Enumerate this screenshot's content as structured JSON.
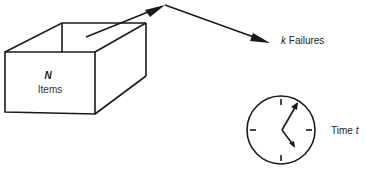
{
  "diagram": {
    "box": {
      "count_symbol": "N",
      "label": "Items"
    },
    "failures": {
      "count_symbol": "k",
      "label": "Failures"
    },
    "time": {
      "label": "Time",
      "symbol": "t"
    }
  },
  "colors": {
    "stroke": "#1a1a1a",
    "background": "#ffffff"
  }
}
